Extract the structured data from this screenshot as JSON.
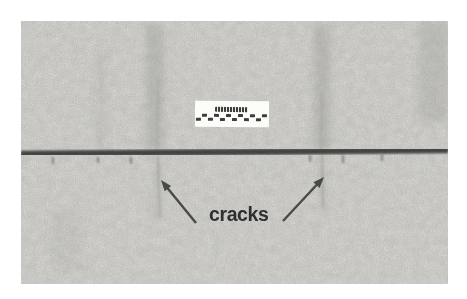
{
  "figure": {
    "annotation_label": "cracks",
    "scale_bar": {
      "checker_segments": 12
    },
    "colors": {
      "page_bg": "#ffffff",
      "photo_base": "#d8d7d3",
      "crack_line": "#4b4b49",
      "arrow": "#383836",
      "label_text": "#2f2f2d",
      "scale_card_bg": "#fcfcf9",
      "scale_mark": "#3d3d3b"
    }
  }
}
